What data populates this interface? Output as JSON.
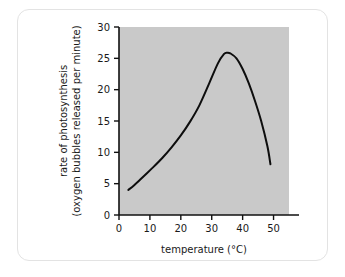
{
  "chart_data": {
    "type": "line",
    "title": "",
    "xlabel": "temperature (°C)",
    "ylabel": "rate of photosynthesis (oxygen bubbles released per minute)",
    "ylabel_line1": "rate of photosynthesis",
    "ylabel_line2": "(oxygen bubbles released per minute)",
    "xlim": [
      0,
      55
    ],
    "ylim": [
      0,
      30
    ],
    "xticks": [
      0,
      10,
      20,
      30,
      40,
      50
    ],
    "yticks": [
      0,
      5,
      10,
      15,
      20,
      25,
      30
    ],
    "xtick_labels": [
      "0",
      "10",
      "20",
      "30",
      "40",
      "50"
    ],
    "ytick_labels": [
      "0",
      "5",
      "10",
      "15",
      "20",
      "25",
      "30"
    ],
    "grid": false,
    "legend": false,
    "plot_background": "#c9c9c9",
    "curve_color": "#0d0d0d",
    "series": [
      {
        "name": "rate of photosynthesis",
        "x": [
          3,
          5,
          8,
          11,
          14,
          17,
          20,
          23,
          26,
          29,
          32,
          34,
          35,
          36,
          38,
          40,
          42,
          44,
          46,
          48,
          49
        ],
        "values": [
          4.0,
          4.8,
          6.2,
          7.6,
          9.1,
          10.8,
          12.7,
          14.9,
          17.5,
          20.8,
          24.2,
          25.7,
          25.9,
          25.8,
          25.0,
          23.3,
          21.0,
          18.2,
          15.0,
          11.0,
          8.1
        ]
      }
    ],
    "annotations": {
      "peak_temperature": 35,
      "peak_rate": 25.9
    }
  },
  "card": {
    "border_color": "#e3e3e3"
  }
}
